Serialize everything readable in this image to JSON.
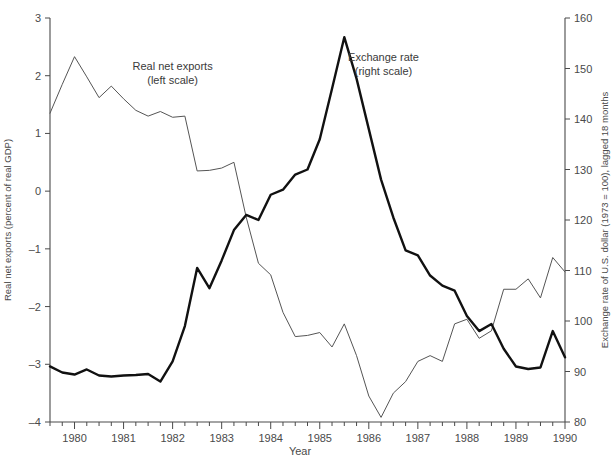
{
  "chart_data": {
    "type": "line",
    "title": "",
    "xlabel": "Year",
    "ylabel": "Real net exports (percent of real GDP)",
    "y2label": "Exchange rate of U.S. dollar (1973 = 100), lagged 18 months",
    "grid": false,
    "legend_position": "inline-annotations",
    "xlim": [
      1979.5,
      1990.0
    ],
    "ylim": [
      -4,
      3
    ],
    "y2lim": [
      80,
      160
    ],
    "x_ticks_major": [
      1980,
      1981,
      1982,
      1983,
      1984,
      1985,
      1986,
      1987,
      1988,
      1989,
      1990
    ],
    "x_tick_labels": [
      "1980",
      "1981",
      "1982",
      "1983",
      "1984",
      "1985",
      "1986",
      "1987",
      "1988",
      "1989",
      "1990"
    ],
    "x_minor_tick_interval": 0.25,
    "y_ticks": [
      3,
      2,
      1,
      0,
      -1,
      -2,
      -3,
      -4
    ],
    "y_tick_labels": [
      "3",
      "2",
      "1",
      "0",
      "-1",
      "-2",
      "-3",
      "-4"
    ],
    "y2_ticks": [
      160,
      150,
      140,
      130,
      120,
      110,
      100,
      90,
      80
    ],
    "y2_tick_labels": [
      "160",
      "150",
      "140",
      "130",
      "120",
      "110",
      "100",
      "90",
      "80"
    ],
    "annotations": [
      {
        "name": "real-net-exports-label",
        "line1": "Real net exports",
        "line2": "(left scale)",
        "x": 1982.0,
        "y": 2.1
      },
      {
        "name": "exchange-rate-label",
        "line1": "Exchange rate",
        "line2": "(right scale)",
        "x": 1986.3,
        "y": 2.25
      }
    ],
    "x": [
      1979.5,
      1979.75,
      1980.0,
      1980.25,
      1980.5,
      1980.75,
      1981.0,
      1981.25,
      1981.5,
      1981.75,
      1982.0,
      1982.25,
      1982.5,
      1982.75,
      1983.0,
      1983.25,
      1983.5,
      1983.75,
      1984.0,
      1984.25,
      1984.5,
      1984.75,
      1985.0,
      1985.25,
      1985.5,
      1985.75,
      1986.0,
      1986.25,
      1986.5,
      1986.75,
      1987.0,
      1987.25,
      1987.5,
      1987.75,
      1988.0,
      1988.25,
      1988.5,
      1988.75,
      1989.0,
      1989.25,
      1989.5,
      1989.75,
      1990.0
    ],
    "series": [
      {
        "name": "Real net exports (left scale)",
        "axis": "left",
        "units": "percent of real GDP",
        "style": "thin",
        "values": [
          1.35,
          1.85,
          2.33,
          1.98,
          1.62,
          1.82,
          1.6,
          1.4,
          1.3,
          1.38,
          1.28,
          1.3,
          0.35,
          0.36,
          0.4,
          0.5,
          -0.45,
          -1.25,
          -1.45,
          -2.1,
          -2.52,
          -2.5,
          -2.45,
          -2.7,
          -2.3,
          -2.85,
          -3.55,
          -3.92,
          -3.5,
          -3.3,
          -2.95,
          -2.85,
          -2.95,
          -2.3,
          -2.22,
          -2.55,
          -2.42,
          -1.7,
          -1.7,
          -1.52,
          -1.85,
          -1.15,
          -1.4
        ]
      },
      {
        "name": "Exchange rate (right scale)",
        "axis": "right",
        "units": "index, 1973 = 100, lagged 18 months",
        "style": "thick",
        "values": [
          91.0,
          89.8,
          89.4,
          90.4,
          89.2,
          89.0,
          89.2,
          89.3,
          89.5,
          88.0,
          92.0,
          99.0,
          110.5,
          106.5,
          112.0,
          118.0,
          121.0,
          120.0,
          125.0,
          126.0,
          129.0,
          130.0,
          136.0,
          146.0,
          156.2,
          148.0,
          138.0,
          128.0,
          120.5,
          114.0,
          113.0,
          109.0,
          107.0,
          106.0,
          101.0,
          98.0,
          99.4,
          94.5,
          91.0,
          90.5,
          90.8,
          98.0,
          92.8
        ]
      }
    ]
  },
  "axis_titles": {
    "left": "Real net exports (percent of real GDP)",
    "right": "Exchange rate of U.S. dollar (1973 = 100), lagged 18 months",
    "bottom": "Year"
  }
}
